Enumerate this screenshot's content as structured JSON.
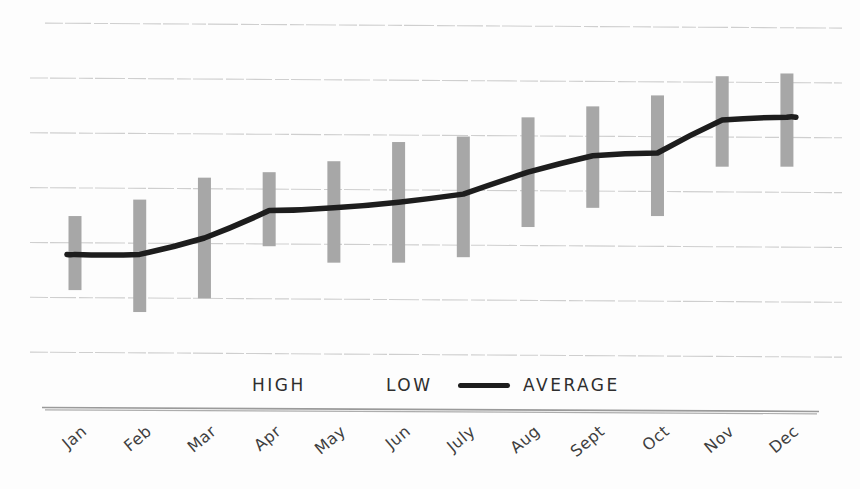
{
  "chart_data": {
    "type": "bar",
    "variant": "floating high-low range bars with average line, hand-drawn sketch style on white paper",
    "title": "",
    "xlabel": "",
    "ylabel": "",
    "categories": [
      "Jan",
      "Feb",
      "Mar",
      "Apr",
      "May",
      "Jun",
      "July",
      "Aug",
      "Sept",
      "Oct",
      "Nov",
      "Dec"
    ],
    "series": [
      {
        "name": "HIGH",
        "render": "bar-range-top",
        "values": [
          35,
          38,
          42,
          43,
          45,
          48.5,
          49.5,
          53,
          55,
          57,
          60.5,
          61
        ]
      },
      {
        "name": "LOW",
        "render": "bar-range-bottom",
        "values": [
          21.5,
          17.5,
          20,
          29.5,
          26.5,
          26.5,
          27.5,
          33,
          36.5,
          35,
          44,
          44
        ]
      },
      {
        "name": "AVERAGE",
        "render": "line",
        "values": [
          28,
          28,
          31,
          36,
          36.5,
          37.5,
          39,
          43,
          46,
          46.5,
          52.5,
          53
        ]
      }
    ],
    "ylim": [
      0,
      75
    ],
    "gridline_step": 10,
    "gridline_values": [
      10,
      20,
      30,
      40,
      50,
      60,
      70
    ],
    "y_tick_labels_visible": false,
    "estimation_note": "no numeric y-axis labels shown; values estimated in gridline units (axis baseline = 0, one gridline = 10)",
    "grid": "horizontal only",
    "legend_position": "bottom-center",
    "legend_entries": [
      "HIGH",
      "LOW",
      "AVERAGE"
    ],
    "x_tick_label_rotation_deg": -40
  },
  "colors": {
    "bar": "#a7a7a7",
    "average_line": "#1d1d1d",
    "gridline": "#c8c8c8",
    "axis_line": "#9a9a9a",
    "tick_label_text": "#3f3f3f",
    "legend_text": "#2e2e2e",
    "background": "#fdfdfd"
  }
}
